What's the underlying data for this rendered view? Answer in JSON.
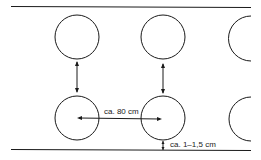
{
  "diagram": {
    "labels": {
      "horizontal_spacing": "ca. 80 cm",
      "edge_gap": "ca. 1–1,5 cm"
    },
    "colors": {
      "stroke": "#1a1a1a",
      "background": "#ffffff"
    },
    "rows": 2,
    "columns_full": 2,
    "columns_partial": 1
  }
}
